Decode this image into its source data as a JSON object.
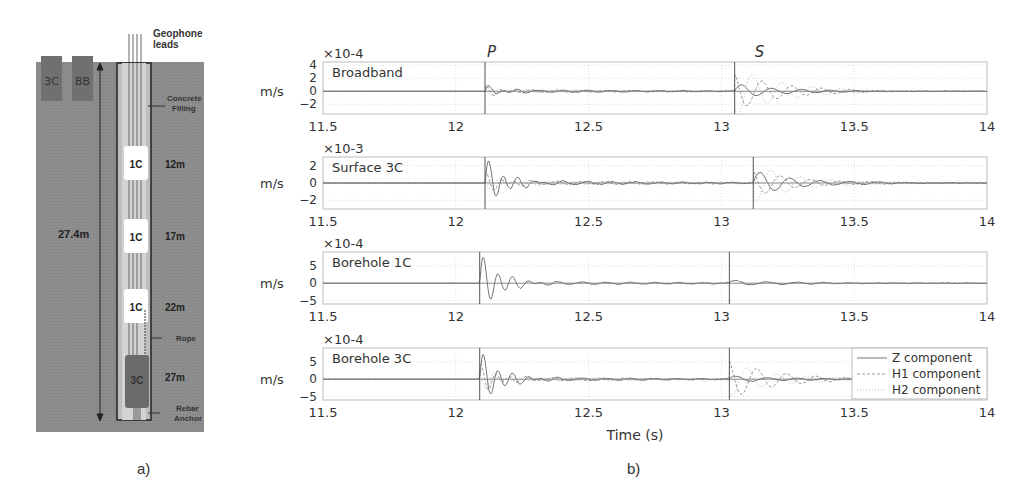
{
  "panel_a": {
    "caption": "a)",
    "geophone_leads": [
      "Geophone",
      "leads"
    ],
    "surface_sensors": [
      "3C",
      "BB"
    ],
    "concrete_filling": [
      "Concrete",
      "Filling"
    ],
    "depth_total": "27.4m",
    "borehole_sensors": [
      {
        "label": "1C",
        "depth": "12m"
      },
      {
        "label": "1C",
        "depth": "17m"
      },
      {
        "label": "1C",
        "depth": "22m"
      },
      {
        "label": "3C",
        "depth": "27m"
      }
    ],
    "rope_label": "Rope",
    "rebar_anchor": [
      "Rebar",
      "Anchor"
    ]
  },
  "panel_b": {
    "caption": "b)",
    "xlabel": "Time (s)",
    "ylabel": "m/s",
    "phase_labels": {
      "p": "P",
      "s": "S"
    },
    "legend": [
      "Z component",
      "H1 component",
      "H2 component"
    ]
  },
  "chart_data": {
    "type": "line",
    "title": "",
    "xlabel": "Time (s)",
    "ylabel": "m/s",
    "xlim": [
      11.5,
      14
    ],
    "xticks": [
      11.5,
      12,
      12.5,
      13,
      13.5,
      14
    ],
    "grid": true,
    "legend_position": "lower right (last subplot)",
    "series_names": [
      "Z component",
      "H1 component",
      "H2 component"
    ],
    "subplots": [
      {
        "name": "Broadband",
        "scale": "×10^-4",
        "yticks": [
          -2,
          0,
          2,
          4
        ],
        "ylim": [
          -3.5,
          4.5
        ],
        "p_pick": 12.11,
        "s_pick": 13.05,
        "p_amp": [
          0.8,
          0.8,
          0.5
        ],
        "s_amp": [
          1.2,
          3.0,
          4.0
        ],
        "noise": 0.25
      },
      {
        "name": "Surface 3C",
        "scale": "×10^-3",
        "yticks": [
          -2,
          0,
          2
        ],
        "ylim": [
          -3,
          3
        ],
        "p_amp": [
          2.8,
          1.0,
          0.8
        ],
        "s_amp": [
          1.4,
          1.5,
          2.2
        ],
        "noise": 0.3,
        "p_pick": 12.11,
        "s_pick": 13.12
      },
      {
        "name": "Borehole 1C",
        "scale": "×10^-4",
        "yticks": [
          -5,
          0,
          5
        ],
        "ylim": [
          -6,
          9
        ],
        "p_amp": [
          8.5
        ],
        "s_amp": [
          1.0
        ],
        "noise": 0.6,
        "p_pick": 12.09,
        "s_pick": 13.03
      },
      {
        "name": "Borehole 3C",
        "scale": "×10^-4",
        "yticks": [
          -5,
          0,
          5
        ],
        "ylim": [
          -6,
          9
        ],
        "p_amp": [
          8.0,
          4.0,
          3.0
        ],
        "s_amp": [
          1.2,
          6.0,
          5.0
        ],
        "noise": 0.6,
        "p_pick": 12.09,
        "s_pick": 13.03
      }
    ]
  },
  "colors": {
    "ground": "#8f8f8f",
    "borehole_fill": "#c9c9c9",
    "sensor_dark": "#6e6e6e",
    "axis": "#555555",
    "trace": "#7a7a7a"
  }
}
